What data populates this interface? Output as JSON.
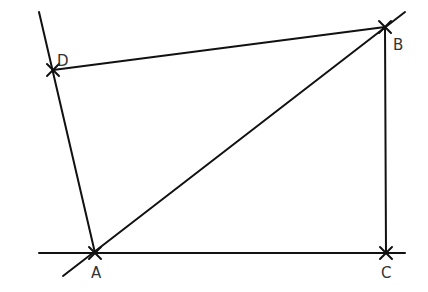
{
  "diagram": {
    "stroke_color": "#111111",
    "label_color": "#333333",
    "points": [
      {
        "id": "A",
        "label": "A"
      },
      {
        "id": "B",
        "label": "B"
      },
      {
        "id": "C",
        "label": "C"
      },
      {
        "id": "D",
        "label": "D"
      }
    ],
    "lines": [
      {
        "id": "line-AD",
        "through": [
          "A",
          "D"
        ],
        "description": "extended line through A and D"
      },
      {
        "id": "line-AB",
        "through": [
          "A",
          "B"
        ],
        "description": "extended diagonal line through A and B"
      },
      {
        "id": "line-AC",
        "through": [
          "A",
          "C"
        ],
        "description": "extended horizontal line through A and C"
      },
      {
        "id": "segment-DB",
        "through": [
          "D",
          "B"
        ],
        "description": "segment from D to B"
      },
      {
        "id": "segment-BC",
        "through": [
          "B",
          "C"
        ],
        "description": "vertical segment from B to C"
      }
    ]
  }
}
